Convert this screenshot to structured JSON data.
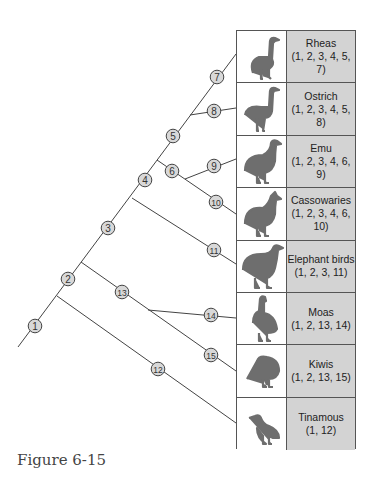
{
  "figure": {
    "caption": "Figure 6-15",
    "type": "cladogram",
    "colors": {
      "line": "#444444",
      "node_fill": "#d8d8d8",
      "label_cell": "#d3d3d3",
      "silhouette": "#6e6e6e"
    }
  },
  "taxa": [
    {
      "name": "Rheas",
      "characters": "(1, 2, 3, 4, 5, 7)",
      "icon": "rhea-silhouette-icon"
    },
    {
      "name": "Ostrich",
      "characters": "(1, 2, 3, 4, 5, 8)",
      "icon": "ostrich-silhouette-icon"
    },
    {
      "name": "Emu",
      "characters": "(1, 2, 3, 4, 6, 9)",
      "icon": "emu-silhouette-icon"
    },
    {
      "name": "Cassowaries",
      "characters": "(1, 2, 3, 4, 6, 10)",
      "icon": "cassowary-silhouette-icon"
    },
    {
      "name": "Elephant birds",
      "characters": "(1, 2, 3, 11)",
      "icon": "elephant-bird-silhouette-icon"
    },
    {
      "name": "Moas",
      "characters": "(1, 2, 13, 14)",
      "icon": "moa-silhouette-icon"
    },
    {
      "name": "Kiwis",
      "characters": "(1, 2, 13, 15)",
      "icon": "kiwi-silhouette-icon"
    },
    {
      "name": "Tinamous",
      "characters": "(1, 12)",
      "icon": "tinamou-silhouette-icon"
    }
  ],
  "nodes": [
    {
      "label": "1",
      "x": 35,
      "y": 326
    },
    {
      "label": "2",
      "x": 68,
      "y": 279
    },
    {
      "label": "3",
      "x": 108,
      "y": 228
    },
    {
      "label": "4",
      "x": 145,
      "y": 180
    },
    {
      "label": "5",
      "x": 173,
      "y": 136
    },
    {
      "label": "6",
      "x": 172,
      "y": 171
    },
    {
      "label": "7",
      "x": 217,
      "y": 77
    },
    {
      "label": "8",
      "x": 214,
      "y": 111
    },
    {
      "label": "9",
      "x": 214,
      "y": 166
    },
    {
      "label": "10",
      "x": 216,
      "y": 202
    },
    {
      "label": "11",
      "x": 214,
      "y": 250
    },
    {
      "label": "12",
      "x": 158,
      "y": 369
    },
    {
      "label": "13",
      "x": 122,
      "y": 292
    },
    {
      "label": "14",
      "x": 211,
      "y": 315
    },
    {
      "label": "15",
      "x": 211,
      "y": 355
    }
  ]
}
